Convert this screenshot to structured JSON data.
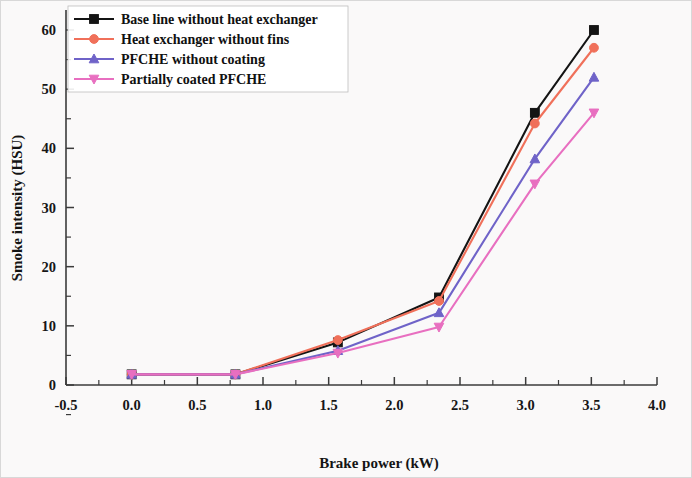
{
  "chart_data": {
    "type": "line",
    "title": "",
    "xlabel": "Brake power (kW)",
    "ylabel": "Smoke intensity (HSU)",
    "xlim": [
      -0.5,
      4.0
    ],
    "ylim": [
      -2,
      63
    ],
    "xticks": [
      "-0.5",
      "0.0",
      "0.5",
      "1.0",
      "1.5",
      "2.0",
      "2.5",
      "3.0",
      "3.5",
      "4.0"
    ],
    "xtick_values": [
      -0.5,
      0.0,
      0.5,
      1.0,
      1.5,
      2.0,
      2.5,
      3.0,
      3.5,
      4.0
    ],
    "yticks": [
      "0",
      "10",
      "20",
      "30",
      "40",
      "50",
      "60"
    ],
    "ytick_values": [
      0,
      10,
      20,
      30,
      40,
      50,
      60
    ],
    "grid": false,
    "legend_position": "top-left",
    "x": [
      0.0,
      0.79,
      1.57,
      2.34,
      3.07,
      3.52
    ],
    "series": [
      {
        "name": "Base line without heat exchanger",
        "color": "#141414",
        "marker": "square",
        "values": [
          1.8,
          1.8,
          7.2,
          14.8,
          46.0,
          60.0
        ]
      },
      {
        "name": "Heat exchanger without fins",
        "color": "#f0705a",
        "marker": "circle",
        "values": [
          1.8,
          1.8,
          7.6,
          14.2,
          44.2,
          57.0
        ]
      },
      {
        "name": "PFCHE without coating",
        "color": "#6f63c8",
        "marker": "triangle-up",
        "values": [
          1.8,
          1.8,
          5.8,
          12.2,
          38.2,
          52.0
        ]
      },
      {
        "name": "Partially coated PFCHE",
        "color": "#e86fc0",
        "marker": "triangle-down",
        "values": [
          1.8,
          1.8,
          5.4,
          9.8,
          34.0,
          46.0
        ]
      }
    ]
  }
}
